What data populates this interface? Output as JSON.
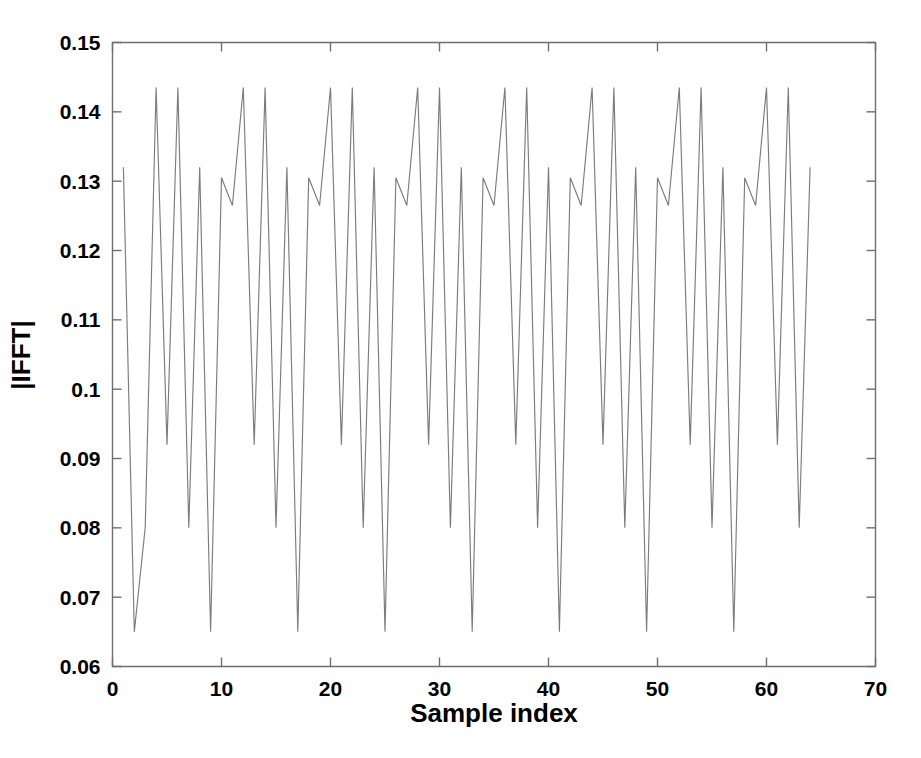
{
  "chart_data": {
    "type": "line",
    "title": "",
    "subtitle": "",
    "xlabel": "Sample index",
    "ylabel": "|IFFT|",
    "xlim": [
      0,
      70
    ],
    "ylim": [
      0.06,
      0.15
    ],
    "xticks": [
      0,
      10,
      20,
      30,
      40,
      50,
      60,
      70
    ],
    "xtick_labels": [
      "0",
      "10",
      "20",
      "30",
      "40",
      "50",
      "60",
      "70"
    ],
    "yticks": [
      0.06,
      0.07,
      0.08,
      0.09,
      0.1,
      0.11,
      0.12,
      0.13,
      0.14,
      0.15
    ],
    "ytick_labels": [
      "0.06",
      "0.07",
      "0.08",
      "0.09",
      "0.1",
      "0.11",
      "0.12",
      "0.13",
      "0.14",
      "0.15"
    ],
    "grid": false,
    "legend": null,
    "legend_position": "none",
    "line_color": "#7c7c7c",
    "series": [
      {
        "name": "|IFFT|",
        "x": [
          1,
          2,
          3,
          4,
          5,
          6,
          7,
          8,
          9,
          10,
          11,
          12,
          13,
          14,
          15,
          16,
          17,
          18,
          19,
          20,
          21,
          22,
          23,
          24,
          25,
          26,
          27,
          28,
          29,
          30,
          31,
          32,
          33,
          34,
          35,
          36,
          37,
          38,
          39,
          40,
          41,
          42,
          43,
          44,
          45,
          46,
          47,
          48,
          49,
          50,
          51,
          52,
          53,
          54,
          55,
          56,
          57,
          58,
          59,
          60,
          61,
          62,
          63,
          64
        ],
        "values": [
          0.132,
          0.065,
          0.08,
          0.1435,
          0.092,
          0.1435,
          0.08,
          0.132,
          0.065,
          0.1305,
          0.1265,
          0.1435,
          0.092,
          0.1435,
          0.08,
          0.132,
          0.065,
          0.1305,
          0.1265,
          0.1435,
          0.092,
          0.1435,
          0.08,
          0.132,
          0.065,
          0.1305,
          0.1265,
          0.1435,
          0.092,
          0.1435,
          0.08,
          0.132,
          0.065,
          0.1305,
          0.1265,
          0.1435,
          0.092,
          0.1435,
          0.08,
          0.132,
          0.065,
          0.1305,
          0.1265,
          0.1435,
          0.092,
          0.1435,
          0.08,
          0.132,
          0.065,
          0.1305,
          0.1265,
          0.1435,
          0.092,
          0.1435,
          0.08,
          0.132,
          0.065,
          0.1305,
          0.1265,
          0.1435,
          0.092,
          0.1435,
          0.08,
          0.132
        ]
      }
    ]
  },
  "axes": {
    "x_title": "Sample index",
    "y_title": "|IFFT|"
  }
}
